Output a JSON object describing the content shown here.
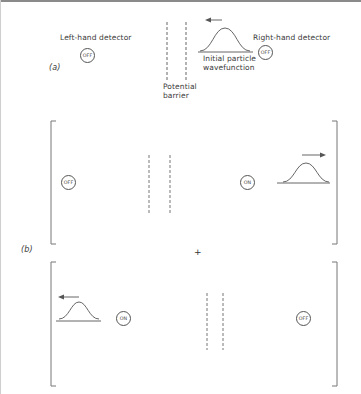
{
  "figure": {
    "type": "quantum tunnelling / entangled detector states diagram",
    "panel_a": {
      "label": "(a)",
      "left_detector": {
        "title": "Left-hand detector",
        "state": "OFF"
      },
      "right_detector": {
        "title": "Right-hand detector",
        "state": "OFF"
      },
      "barrier_label_line1": "Potential",
      "barrier_label_line2": "barrier",
      "wavefunction_label_line1": "Initial particle",
      "wavefunction_label_line2": "wavefunction",
      "wavefunction_direction": "left"
    },
    "panel_b": {
      "label": "(b)",
      "operator": "+",
      "term1": {
        "left_detector_state": "OFF",
        "right_detector_state": "ON",
        "wavefunction_position": "right",
        "wavefunction_direction": "right"
      },
      "term2": {
        "left_detector_state": "ON",
        "right_detector_state": "OFF",
        "wavefunction_position": "left",
        "wavefunction_direction": "left"
      }
    },
    "colors": {
      "line": "#555555",
      "barrier": "#666666",
      "text": "#3a3a3a",
      "background": "#ffffff"
    }
  }
}
